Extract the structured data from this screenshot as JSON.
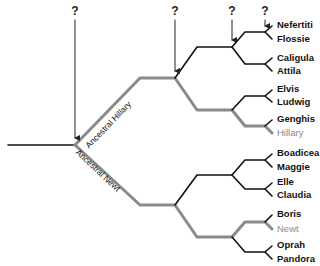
{
  "diagram": {
    "type": "phylogenetic-tree",
    "colors": {
      "line": "#111111",
      "highlight": "#8a8a8a"
    },
    "branch_labels": [
      {
        "text": "Ancestral Hillary",
        "color": "#111111"
      },
      {
        "text": "Ancestral Newt",
        "color": "#111111"
      }
    ],
    "question_marks": [
      "?",
      "?",
      "?",
      "?"
    ],
    "leaves": [
      {
        "name": "Nefertiti",
        "highlight": false
      },
      {
        "name": "Flossie",
        "highlight": false
      },
      {
        "name": "Caligula",
        "highlight": false
      },
      {
        "name": "Attila",
        "highlight": false
      },
      {
        "name": "Elvis",
        "highlight": false
      },
      {
        "name": "Ludwig",
        "highlight": false
      },
      {
        "name": "Genghis",
        "highlight": false
      },
      {
        "name": "Hillary",
        "highlight": true
      },
      {
        "name": "Boadicea",
        "highlight": false
      },
      {
        "name": "Maggie",
        "highlight": false
      },
      {
        "name": "Elle",
        "highlight": false
      },
      {
        "name": "Claudia",
        "highlight": false
      },
      {
        "name": "Boris",
        "highlight": false
      },
      {
        "name": "Newt",
        "highlight": true
      },
      {
        "name": "Oprah",
        "highlight": false
      },
      {
        "name": "Pandora",
        "highlight": false
      }
    ]
  }
}
